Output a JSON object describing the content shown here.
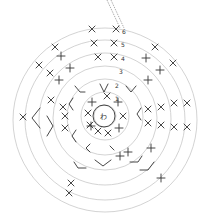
{
  "diagram": {
    "type": "crochet-chart",
    "center_label": "わ",
    "rows": [
      "1",
      "2",
      "3",
      "4",
      "5",
      "6"
    ],
    "ring_color": "#c8c8c8",
    "stitch_color": "#333333"
  }
}
